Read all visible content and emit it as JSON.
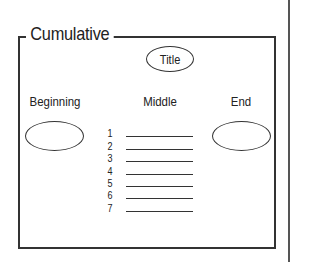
{
  "frame": {
    "title": "Cumulative"
  },
  "diagram": {
    "title_oval": "Title",
    "columns": {
      "beginning": "Beginning",
      "middle": "Middle",
      "end": "End"
    },
    "middle_items": [
      {
        "number": "1",
        "value": ""
      },
      {
        "number": "2",
        "value": ""
      },
      {
        "number": "3",
        "value": ""
      },
      {
        "number": "4",
        "value": ""
      },
      {
        "number": "5",
        "value": ""
      },
      {
        "number": "6",
        "value": ""
      },
      {
        "number": "7",
        "value": ""
      }
    ]
  }
}
